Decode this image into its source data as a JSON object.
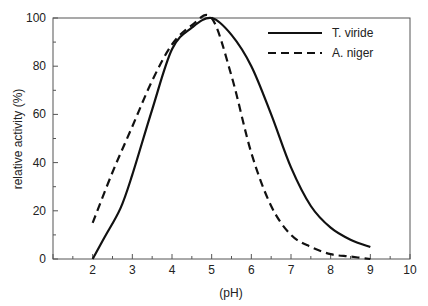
{
  "chart_data": {
    "type": "line",
    "title": "",
    "xlabel": "(pH)",
    "ylabel": "relative activity (%)",
    "xlim": [
      1,
      10
    ],
    "ylim": [
      0,
      100
    ],
    "xticks": [
      2,
      3,
      4,
      5,
      6,
      7,
      8,
      9,
      10
    ],
    "yticks": [
      0,
      20,
      40,
      60,
      80,
      100
    ],
    "grid": false,
    "legend_position": "upper right",
    "series": [
      {
        "name": "T. viride",
        "style": "solid",
        "x": [
          2,
          2.3,
          2.7,
          3,
          3.5,
          4,
          4.5,
          5,
          5.5,
          6,
          6.5,
          7,
          7.5,
          8,
          8.5,
          9
        ],
        "y": [
          0,
          9,
          21,
          35,
          62,
          87,
          96,
          100,
          93,
          80,
          60,
          38,
          22,
          13,
          8,
          5
        ]
      },
      {
        "name": "A. niger",
        "style": "dashed",
        "x": [
          2,
          2.5,
          3,
          3.5,
          4,
          4.5,
          5,
          5.5,
          6,
          6.5,
          7,
          7.5,
          8,
          8.5,
          9
        ],
        "y": [
          15,
          36,
          55,
          74,
          89,
          97,
          100,
          76,
          44,
          22,
          10,
          5,
          2,
          1,
          0
        ]
      }
    ]
  }
}
